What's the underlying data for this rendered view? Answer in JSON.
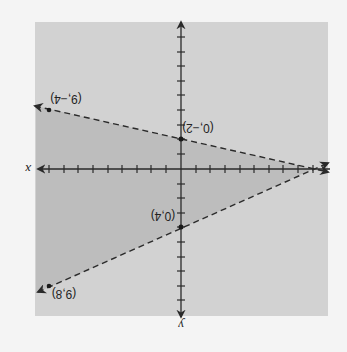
{
  "figure": {
    "orientation": "rotated 180 degrees",
    "background_color": "#f4f4f4",
    "plot_color": "#d2d2d2",
    "shaded_color": "#bdbdbd",
    "line_color": "#2a2a2a"
  },
  "axes": {
    "x_label": "x",
    "y_label": "y"
  },
  "points": [
    {
      "id": "p1",
      "label": "(9,−4)"
    },
    {
      "id": "p2",
      "label": "(0,−2)"
    },
    {
      "id": "p3",
      "label": "(0,4)"
    },
    {
      "id": "p4",
      "label": "(9,8)"
    }
  ],
  "lines": [
    {
      "name": "upper-boundary",
      "through": [
        "(9,-4)",
        "(0,-2)"
      ],
      "style": "dashed"
    },
    {
      "name": "lower-boundary",
      "through": [
        "(0,4)",
        "(9,8)"
      ],
      "style": "dashed"
    }
  ]
}
